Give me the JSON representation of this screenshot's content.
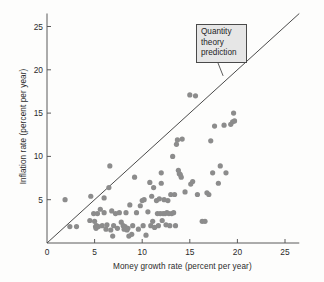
{
  "chart_data": {
    "type": "scatter",
    "title": "",
    "xlabel": "Money growth rate (percent per year)",
    "ylabel": "Inflation rate (percent per year)",
    "xlim": [
      0,
      26.5
    ],
    "ylim": [
      0,
      26.5
    ],
    "xticks": [
      0,
      5,
      10,
      15,
      20,
      25
    ],
    "yticks": [
      0,
      5,
      10,
      15,
      20,
      25
    ],
    "xtick_labels": [
      "0",
      "5",
      "10",
      "15",
      "20",
      "25"
    ],
    "ytick_labels": [
      "0",
      "5",
      "10",
      "15",
      "20",
      "25"
    ],
    "grid": false,
    "legend": false,
    "point_color": "#8c8c8c",
    "point_radius": 2.6,
    "line_color": "#4a4a4a",
    "axis_color": "#5a5a5a",
    "reference_line": {
      "name": "Quantity theory prediction",
      "type": "45-degree-line",
      "from": [
        0,
        0
      ],
      "to": [
        26.5,
        26.5
      ],
      "slope": 1,
      "intercept": 0
    },
    "annotation": {
      "lines": [
        "Quantity",
        "theory",
        "prediction"
      ],
      "text": "Quantity theory prediction",
      "anchor_point": [
        18.5,
        19.3
      ]
    },
    "points": [
      [
        1.9,
        5.0
      ],
      [
        2.4,
        1.9
      ],
      [
        3.1,
        1.9
      ],
      [
        4.5,
        2.6
      ],
      [
        4.6,
        5.4
      ],
      [
        4.9,
        3.4
      ],
      [
        5.0,
        2.5
      ],
      [
        5.1,
        1.9
      ],
      [
        5.15,
        1.7
      ],
      [
        5.2,
        2.0
      ],
      [
        5.3,
        3.4
      ],
      [
        5.4,
        1.9
      ],
      [
        5.6,
        3.9
      ],
      [
        5.8,
        2.0
      ],
      [
        6.0,
        5.2
      ],
      [
        6.0,
        3.5
      ],
      [
        6.2,
        1.6
      ],
      [
        6.3,
        2.1
      ],
      [
        6.5,
        6.4
      ],
      [
        6.6,
        8.9
      ],
      [
        6.7,
        1.5
      ],
      [
        6.8,
        3.7
      ],
      [
        6.9,
        0.8
      ],
      [
        7.0,
        2.0
      ],
      [
        7.2,
        3.4
      ],
      [
        7.4,
        1.7
      ],
      [
        7.6,
        3.5
      ],
      [
        7.8,
        2.4
      ],
      [
        8.0,
        2.0
      ],
      [
        8.1,
        1.6
      ],
      [
        8.2,
        1.9
      ],
      [
        8.3,
        3.5
      ],
      [
        8.4,
        1.5
      ],
      [
        8.5,
        1.7
      ],
      [
        8.6,
        0.8
      ],
      [
        8.7,
        4.4
      ],
      [
        8.9,
        1.0
      ],
      [
        9.0,
        2.0
      ],
      [
        9.2,
        7.6
      ],
      [
        9.4,
        3.5
      ],
      [
        9.6,
        1.6
      ],
      [
        9.8,
        4.3
      ],
      [
        10.0,
        4.9
      ],
      [
        10.1,
        2.0
      ],
      [
        10.2,
        5.0
      ],
      [
        10.4,
        0.9
      ],
      [
        10.6,
        3.6
      ],
      [
        10.8,
        7.0
      ],
      [
        10.9,
        2.0
      ],
      [
        11.0,
        5.4
      ],
      [
        11.1,
        2.5
      ],
      [
        11.2,
        6.4
      ],
      [
        11.3,
        1.8
      ],
      [
        11.5,
        4.9
      ],
      [
        11.6,
        3.4
      ],
      [
        11.7,
        2.0
      ],
      [
        11.8,
        5.1
      ],
      [
        11.9,
        3.4
      ],
      [
        12.0,
        8.1
      ],
      [
        12.0,
        6.9
      ],
      [
        12.1,
        2.6
      ],
      [
        12.2,
        3.4
      ],
      [
        12.3,
        5.0
      ],
      [
        12.4,
        3.4
      ],
      [
        12.5,
        2.1
      ],
      [
        12.6,
        3.5
      ],
      [
        12.7,
        4.9
      ],
      [
        12.8,
        3.4
      ],
      [
        12.9,
        2.0
      ],
      [
        13.0,
        5.6
      ],
      [
        13.1,
        3.4
      ],
      [
        13.2,
        10.0
      ],
      [
        13.3,
        3.5
      ],
      [
        13.4,
        5.6
      ],
      [
        13.5,
        2.0
      ],
      [
        13.6,
        11.4
      ],
      [
        13.7,
        11.9
      ],
      [
        13.8,
        8.4
      ],
      [
        13.9,
        8.0
      ],
      [
        14.0,
        7.9
      ],
      [
        14.1,
        7.6
      ],
      [
        14.2,
        12.0
      ],
      [
        14.5,
        5.9
      ],
      [
        15.0,
        17.1
      ],
      [
        15.1,
        6.8
      ],
      [
        15.3,
        7.1
      ],
      [
        15.6,
        17.0
      ],
      [
        15.8,
        5.6
      ],
      [
        16.3,
        2.5
      ],
      [
        16.6,
        2.5
      ],
      [
        16.8,
        5.8
      ],
      [
        17.0,
        5.6
      ],
      [
        17.2,
        11.8
      ],
      [
        17.4,
        8.1
      ],
      [
        17.6,
        13.5
      ],
      [
        18.0,
        6.9
      ],
      [
        18.2,
        8.9
      ],
      [
        18.6,
        13.6
      ],
      [
        18.8,
        8.1
      ],
      [
        19.3,
        13.7
      ],
      [
        19.5,
        14.0
      ],
      [
        19.6,
        15.0
      ],
      [
        19.7,
        14.1
      ]
    ]
  },
  "axes": {
    "x_title": "Money growth rate (percent per year)",
    "y_title": "Inflation rate (percent per year)"
  },
  "callout": {
    "line1": "Quantity",
    "line2": "theory",
    "line3": "prediction"
  },
  "ticks": {
    "x": [
      "0",
      "5",
      "10",
      "15",
      "20",
      "25"
    ],
    "y": [
      "0",
      "5",
      "10",
      "15",
      "20",
      "25"
    ]
  }
}
